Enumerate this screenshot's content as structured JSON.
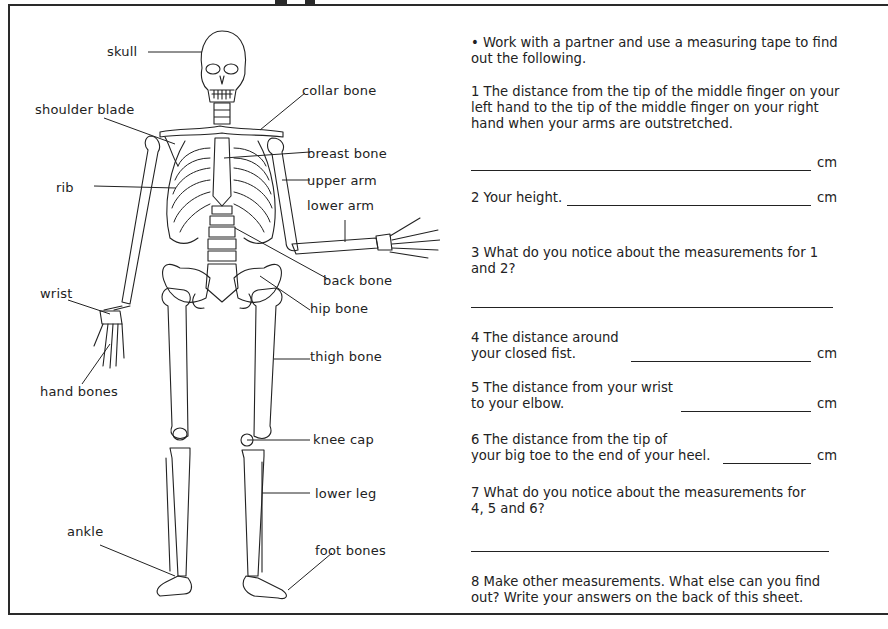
{
  "worksheet": {
    "intro": "•  Work with a partner and use a measuring tape to find out the following.",
    "unit": "cm",
    "questions": [
      {
        "number": "1",
        "text": "1 The distance from the tip of the middle finger on your left hand to the tip of the middle finger on your right hand when your arms are outstretched.",
        "answer": "",
        "unit": "cm"
      },
      {
        "number": "2",
        "text": "2 Your height.",
        "answer": "",
        "unit": "cm"
      },
      {
        "number": "3",
        "text": "3 What do you notice about the measurements for 1 and 2?",
        "answer": ""
      },
      {
        "number": "4",
        "line1": "4 The distance around",
        "line2": "your closed fist.",
        "answer": "",
        "unit": "cm"
      },
      {
        "number": "5",
        "line1": "5 The distance from your wrist",
        "line2": "to your elbow.",
        "answer": "",
        "unit": "cm"
      },
      {
        "number": "6",
        "line1": "6 The distance from the tip of",
        "line2": "your big toe to the end of your heel.",
        "answer": "",
        "unit": "cm"
      },
      {
        "number": "7",
        "text": "7 What do you notice about the measurements for 4, 5 and 6?",
        "answer": ""
      },
      {
        "number": "8",
        "text": "8 Make other measurements. What else can you find out? Write your answers on the back of this sheet."
      }
    ]
  },
  "diagram": {
    "labels": {
      "skull": "skull",
      "collar_bone": "collar bone",
      "shoulder_blade": "shoulder blade",
      "breast_bone": "breast bone",
      "rib": "rib",
      "upper_arm": "upper arm",
      "lower_arm": "lower arm",
      "back_bone": "back bone",
      "wrist": "wrist",
      "hip_bone": "hip bone",
      "thigh_bone": "thigh bone",
      "hand_bones": "hand bones",
      "knee_cap": "knee cap",
      "lower_leg": "lower leg",
      "ankle": "ankle",
      "foot_bones": "foot bones"
    }
  }
}
